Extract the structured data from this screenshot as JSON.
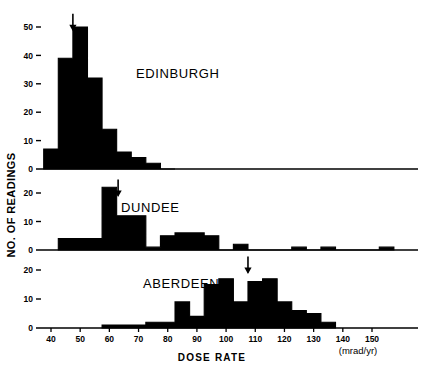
{
  "figure": {
    "ylabel": "NO. OF READINGS",
    "xlabel": "DOSE RATE",
    "units": "(mrad/yr)"
  },
  "chart_data": {
    "type": "bar",
    "title": "",
    "xlabel": "DOSE RATE",
    "ylabel": "NO. OF READINGS",
    "units": "(mrad/yr)",
    "xlim": [
      35,
      158
    ],
    "xticks": [
      40,
      50,
      60,
      70,
      80,
      90,
      100,
      110,
      120,
      130,
      140,
      150
    ],
    "xticklabels": [
      "40",
      "50",
      "60",
      "70",
      "80",
      "90",
      "100",
      "110",
      "120",
      "130",
      "140",
      "150"
    ],
    "bin_width": 5,
    "grid": false,
    "legend": "none",
    "panels": [
      {
        "name": "EDINBURGH",
        "label": "EDINBURGH",
        "ylim": [
          0,
          54
        ],
        "yticks": [
          0,
          10,
          20,
          30,
          40,
          50
        ],
        "yticklabels": [
          "0",
          "10",
          "20",
          "30",
          "40",
          "50"
        ],
        "arrow_x": 47.5,
        "bin_starts": [
          37.5,
          42.5,
          47.5,
          52.5,
          57.5,
          62.5,
          67.5,
          72.5,
          77.5
        ],
        "values": [
          7,
          39,
          50,
          32,
          14,
          6,
          4,
          2,
          0
        ]
      },
      {
        "name": "DUNDEE",
        "label": "DUNDEE",
        "ylim": [
          0,
          24
        ],
        "yticks": [
          0,
          10,
          20
        ],
        "yticklabels": [
          "0",
          "10",
          "20"
        ],
        "arrow_x": 63,
        "bin_starts": [
          42.5,
          47.5,
          52.5,
          57.5,
          62.5,
          67.5,
          72.5,
          77.5,
          82.5,
          87.5,
          92.5,
          97.5,
          102.5,
          107.5,
          112.5,
          117.5,
          122.5,
          127.5,
          132.5,
          137.5,
          142.5,
          147.5,
          152.5
        ],
        "values": [
          4,
          4,
          4,
          22,
          12,
          12,
          1,
          5,
          6,
          6,
          5,
          0,
          2,
          0,
          0,
          0,
          1,
          0,
          1,
          0,
          0,
          0,
          1
        ]
      },
      {
        "name": "ABERDEEN",
        "label": "ABERDEEN",
        "ylim": [
          0,
          24
        ],
        "yticks": [
          0,
          10,
          20
        ],
        "yticklabels": [
          "0",
          "10",
          "20"
        ],
        "arrow_x": 107.5,
        "bin_starts": [
          57.5,
          62.5,
          67.5,
          72.5,
          77.5,
          82.5,
          87.5,
          92.5,
          97.5,
          102.5,
          107.5,
          112.5,
          117.5,
          122.5,
          127.5,
          132.5
        ],
        "values": [
          1,
          1,
          1,
          2,
          2,
          9,
          4,
          15,
          17,
          9,
          16,
          17,
          9,
          6,
          5,
          2
        ]
      }
    ]
  }
}
